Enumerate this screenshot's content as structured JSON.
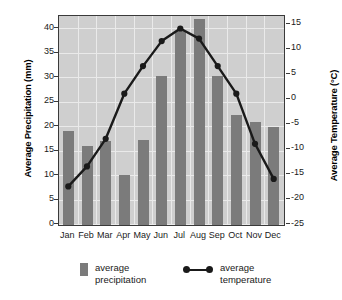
{
  "chart_data": {
    "type": "bar",
    "title": "",
    "categories": [
      "Jan",
      "Feb",
      "Mar",
      "Apr",
      "May",
      "Jun",
      "Jul",
      "Aug",
      "Sep",
      "Oct",
      "Nov",
      "Dec"
    ],
    "xlabel": "",
    "ylabel": "Average Precipitation (mm)",
    "ylabel_right": "Average Temperature (°C)",
    "ylim": [
      0,
      42.5
    ],
    "ylim_right": [
      -25,
      16.5
    ],
    "yticks": [
      0,
      5,
      10,
      15,
      20,
      25,
      30,
      35,
      40
    ],
    "yticks_right": [
      -25,
      -20,
      -15,
      -10,
      -5,
      0,
      5,
      10,
      15
    ],
    "ytick_labels": [
      "0",
      "5",
      "10",
      "15",
      "20",
      "25",
      "30",
      "35",
      "40"
    ],
    "ytick_labels_right": [
      "-25",
      "-20",
      "-15",
      "-10",
      "-5",
      "0",
      "5",
      "10",
      "15"
    ],
    "grid": true,
    "legend_position": "below",
    "series": [
      {
        "name": "average precipitation",
        "type": "bar",
        "axis": "left",
        "unit": "mm",
        "color": "#7b7b7b",
        "values": [
          19.2,
          16.1,
          17.2,
          10.2,
          17.3,
          30.4,
          39.6,
          42.2,
          30.5,
          22.4,
          21.0,
          20.0
        ]
      },
      {
        "name": "average temperature",
        "type": "line",
        "axis": "right",
        "unit": "°C",
        "color": "#1a1a1a",
        "values": [
          -17.5,
          -13.5,
          -8.0,
          1.0,
          6.5,
          11.5,
          14.0,
          12.0,
          6.5,
          1.0,
          -9.0,
          -16.0
        ]
      }
    ]
  },
  "legend": {
    "items": [
      {
        "label_line1": "average",
        "label_line2": "precipitation",
        "marker": "bar-swatch"
      },
      {
        "label_line1": "average",
        "label_line2": "temperature",
        "marker": "line-marker"
      }
    ]
  }
}
